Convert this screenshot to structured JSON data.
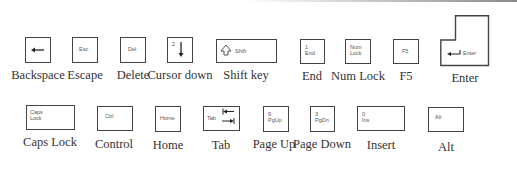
{
  "keys": [
    {
      "id": "backspace",
      "cap_text": "",
      "caption": "Backspace",
      "icon": "left-arrow-icon"
    },
    {
      "id": "escape",
      "cap_text": "Esc",
      "caption": "Escape"
    },
    {
      "id": "delete",
      "cap_text": "Del",
      "caption": "Delete"
    },
    {
      "id": "cursor-down",
      "cap_text": "2",
      "caption": "Cursor down",
      "icon": "down-arrow-icon"
    },
    {
      "id": "shift",
      "cap_text": "Shift",
      "caption": "Shift key",
      "icon": "shift-arrow-icon"
    },
    {
      "id": "end",
      "cap_text": "1",
      "cap_text2": "End",
      "caption": "End"
    },
    {
      "id": "num-lock",
      "cap_text": "Num",
      "cap_text2": "Lock",
      "caption": "Num Lock"
    },
    {
      "id": "f5",
      "cap_text": "F5",
      "caption": "F5"
    },
    {
      "id": "enter",
      "cap_text": "Enter",
      "caption": "Enter",
      "icon": "return-arrow-icon"
    },
    {
      "id": "caps-lock",
      "cap_text": "Caps",
      "cap_text2": "Lock",
      "caption": "Caps Lock"
    },
    {
      "id": "control",
      "cap_text": "Ctrl",
      "caption": "Control"
    },
    {
      "id": "home",
      "cap_text": "Home",
      "caption": "Home"
    },
    {
      "id": "tab",
      "cap_text": "Tab",
      "caption": "Tab",
      "icon": "tab-arrows-icon"
    },
    {
      "id": "page-up",
      "cap_text": "9",
      "cap_text2": "PgUp",
      "caption": "Page Up"
    },
    {
      "id": "page-down",
      "cap_text": "3",
      "cap_text2": "PgDn",
      "caption": "Page Down"
    },
    {
      "id": "insert",
      "cap_text": "0",
      "cap_text2": "Ins",
      "caption": "Insert"
    },
    {
      "id": "alt",
      "cap_text": "Alt",
      "caption": "Alt"
    }
  ]
}
